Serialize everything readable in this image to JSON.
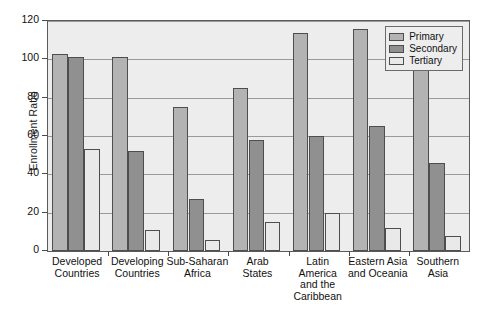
{
  "chart_data": {
    "type": "bar",
    "title": "",
    "subtitle": "",
    "xlabel": "",
    "ylabel": "Enrollment Ratio",
    "categories": [
      "Developed\nCountries",
      "Developing\nCountries",
      "Sub-Saharan\nAfrica",
      "Arab\nStates",
      "Latin\nAmerica\nand the\nCaribbean",
      "Eastern Asia\nand Oceania",
      "Southern\nAsia"
    ],
    "series": [
      {
        "name": "Primary",
        "color": "#b3b3b3",
        "values": [
          103,
          101,
          75,
          85,
          114,
          116,
          97
        ]
      },
      {
        "name": "Secondary",
        "color": "#909090",
        "values": [
          101,
          52,
          27,
          58,
          60,
          65,
          46
        ]
      },
      {
        "name": "Tertiary",
        "color": "#e9e9e9",
        "values": [
          53,
          11,
          6,
          15,
          20,
          12,
          8
        ]
      }
    ],
    "ylim": [
      0,
      120
    ],
    "ytick_labels": [
      "0",
      "20",
      "40",
      "60",
      "80",
      "100",
      "120"
    ],
    "ytick_values": [
      0,
      20,
      40,
      60,
      80,
      100,
      120
    ],
    "grid": true,
    "legend_position": "top-right-inside",
    "plot_background": "#ededed",
    "frame_color": "#5a5a5a"
  },
  "legend": {
    "items": [
      {
        "label": "Primary"
      },
      {
        "label": "Secondary"
      },
      {
        "label": "Tertiary"
      }
    ]
  }
}
